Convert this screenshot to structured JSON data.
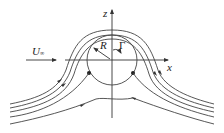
{
  "diagram": {
    "labels": {
      "z_axis": "z",
      "x_axis": "x",
      "radius": "R",
      "circulation": "Γ",
      "freestream": "U",
      "freestream_sub": "∞"
    },
    "elements": {
      "cylinder": {
        "center": [
          112,
          60
        ],
        "radius": 25
      },
      "stagnation_points": [
        [
          89,
          73
        ],
        [
          135,
          73
        ]
      ],
      "streamline_count": 5
    },
    "colors": {
      "stroke": "#333333"
    }
  }
}
